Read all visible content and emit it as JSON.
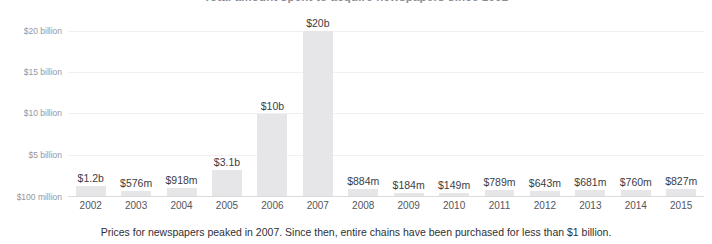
{
  "chart_data": {
    "type": "bar",
    "title": "Total amount spent to acquire newspapers since 2002",
    "xlabel": "",
    "ylabel": "",
    "ylim": [
      0,
      21800000000
    ],
    "grid": true,
    "legend": null,
    "categories": [
      "2002",
      "2003",
      "2004",
      "2005",
      "2006",
      "2007",
      "2008",
      "2009",
      "2010",
      "2011",
      "2012",
      "2013",
      "2014",
      "2015"
    ],
    "values": [
      1200000000,
      576000000,
      918000000,
      3100000000,
      10000000000,
      20000000000,
      884000000,
      184000000,
      149000000,
      789000000,
      643000000,
      681000000,
      760000000,
      827000000
    ],
    "data_labels": [
      "$1.2b",
      "$576m",
      "$918m",
      "$3.1b",
      "$10b",
      "$20b",
      "$884m",
      "$184m",
      "$149m",
      "$789m",
      "$643m",
      "$681m",
      "$760m",
      "$827m"
    ],
    "y_ticks": [
      {
        "label": "$20 billion",
        "value": 20000000000
      },
      {
        "label": "$15 billion",
        "value": 15000000000
      },
      {
        "label": "$10 billion",
        "value": 10000000000
      },
      {
        "label": "$5 billion",
        "value": 5000000000
      },
      {
        "label": "$100 million",
        "value": 100000000
      }
    ],
    "bar_color": "#e6e6e8",
    "gridline_color": "#f0f0f2",
    "axis_color": "#dcdcdf"
  },
  "caption": {
    "text": "Prices for newspapers peaked in 2007. Since then, entire chains have been purchased for less than $1 billion."
  }
}
